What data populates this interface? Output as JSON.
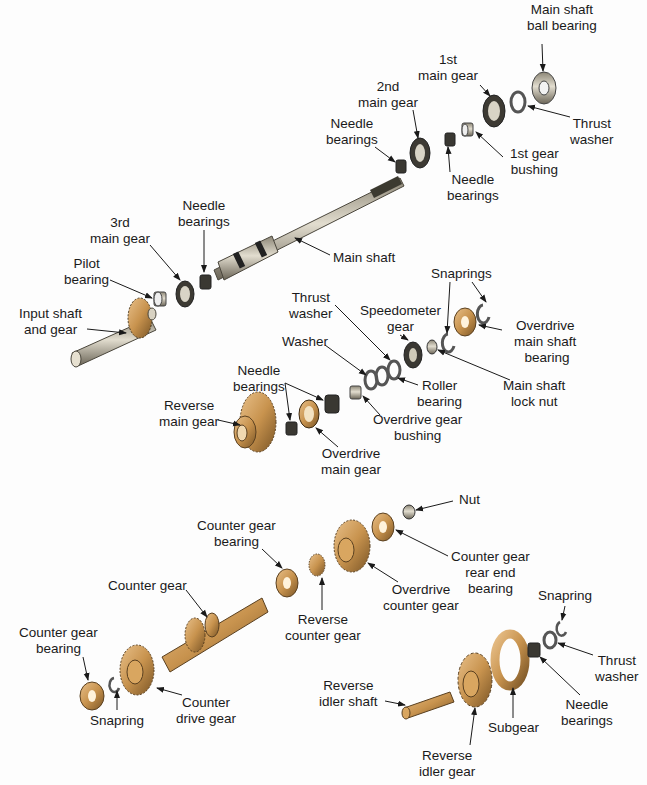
{
  "diagram": {
    "colors": {
      "steel": "#c9c3b4",
      "steel_dark": "#5a5548",
      "bronze": "#c8934e",
      "bronze_dark": "#7a5526",
      "arrow": "#1a1a1a",
      "text": "#1a1a1a"
    },
    "labels": [
      {
        "id": "main-shaft-ball-bearing",
        "text": "Main shaft\nball bearing",
        "x": 562,
        "y": 2,
        "align": "center"
      },
      {
        "id": "1st-main-gear",
        "text": "1st\nmain gear",
        "x": 448,
        "y": 52,
        "align": "center"
      },
      {
        "id": "2nd-main-gear",
        "text": "2nd\nmain gear",
        "x": 388,
        "y": 79,
        "align": "center"
      },
      {
        "id": "thrust-washer-top",
        "text": "Thrust\nwasher",
        "x": 592,
        "y": 116,
        "align": "center"
      },
      {
        "id": "needle-bearings-top-left",
        "text": "Needle\nbearings",
        "x": 352,
        "y": 116,
        "align": "center"
      },
      {
        "id": "1st-gear-bushing",
        "text": "1st gear\nbushing",
        "x": 534,
        "y": 146,
        "align": "center"
      },
      {
        "id": "needle-bearings-top-mid",
        "text": "Needle\nbearings",
        "x": 473,
        "y": 172,
        "align": "center"
      },
      {
        "id": "needle-bearings-3rd",
        "text": "Needle\nbearings",
        "x": 204,
        "y": 198,
        "align": "center"
      },
      {
        "id": "3rd-main-gear",
        "text": "3rd\nmain gear",
        "x": 120,
        "y": 215,
        "align": "center"
      },
      {
        "id": "pilot-bearing",
        "text": "Pilot\nbearing",
        "x": 86,
        "y": 256,
        "align": "center"
      },
      {
        "id": "main-shaft",
        "text": "Main shaft",
        "x": 364,
        "y": 250,
        "align": "center"
      },
      {
        "id": "snaprings",
        "text": "Snaprings",
        "x": 461,
        "y": 266,
        "align": "center"
      },
      {
        "id": "input-shaft-and-gear",
        "text": "Input shaft\nand gear",
        "x": 50,
        "y": 306,
        "align": "center"
      },
      {
        "id": "thrust-washer-mid",
        "text": "Thrust\nwasher",
        "x": 311,
        "y": 290,
        "align": "center"
      },
      {
        "id": "speedometer-gear",
        "text": "Speedometer\ngear",
        "x": 400,
        "y": 303,
        "align": "center"
      },
      {
        "id": "overdrive-main-shaft-bearing",
        "text": "Overdrive\nmain shaft\n bearing",
        "x": 545,
        "y": 318,
        "align": "center"
      },
      {
        "id": "washer",
        "text": "Washer",
        "x": 305,
        "y": 334,
        "align": "center"
      },
      {
        "id": "needle-bearings-mid",
        "text": "Needle\nbearings",
        "x": 259,
        "y": 363,
        "align": "center"
      },
      {
        "id": "roller-bearing",
        "text": "Roller\nbearing",
        "x": 439,
        "y": 378,
        "align": "center"
      },
      {
        "id": "main-shaft-lock-nut",
        "text": "Main shaft\nlock nut",
        "x": 534,
        "y": 378,
        "align": "center"
      },
      {
        "id": "reverse-main-gear",
        "text": "Reverse\nmain gear",
        "x": 189,
        "y": 398,
        "align": "center"
      },
      {
        "id": "overdrive-gear-bushing",
        "text": "Overdrive gear\nbushing",
        "x": 417,
        "y": 412,
        "align": "center"
      },
      {
        "id": "overdrive-main-gear",
        "text": "Overdrive\nmain gear",
        "x": 351,
        "y": 446,
        "align": "center"
      },
      {
        "id": "nut",
        "text": "Nut",
        "x": 469,
        "y": 492,
        "align": "center"
      },
      {
        "id": "counter-gear-bearing-top",
        "text": "Counter gear\nbearing",
        "x": 236,
        "y": 518,
        "align": "center"
      },
      {
        "id": "counter-gear-rear-end-bearing",
        "text": "Counter gear\nrear end\nbearing",
        "x": 490,
        "y": 549,
        "align": "center"
      },
      {
        "id": "overdrive-counter-gear",
        "text": "Overdrive\ncounter gear",
        "x": 421,
        "y": 582,
        "align": "center"
      },
      {
        "id": "counter-gear",
        "text": "Counter gear",
        "x": 147,
        "y": 578,
        "align": "center"
      },
      {
        "id": "snapring-right",
        "text": "Snapring",
        "x": 565,
        "y": 588,
        "align": "center"
      },
      {
        "id": "reverse-counter-gear",
        "text": "Reverse\ncounter gear",
        "x": 323,
        "y": 612,
        "align": "center"
      },
      {
        "id": "counter-gear-bearing-left",
        "text": "Counter gear\nbearing",
        "x": 58,
        "y": 625,
        "align": "center"
      },
      {
        "id": "thrust-washer-bottom",
        "text": "Thrust\nwasher",
        "x": 617,
        "y": 653,
        "align": "center"
      },
      {
        "id": "counter-drive-gear",
        "text": "Counter\ndrive gear",
        "x": 206,
        "y": 695,
        "align": "center"
      },
      {
        "id": "snapring-left",
        "text": "Snapring",
        "x": 117,
        "y": 713,
        "align": "center"
      },
      {
        "id": "reverse-idler-shaft",
        "text": "Reverse\nidler shaft",
        "x": 348,
        "y": 678,
        "align": "center"
      },
      {
        "id": "needle-bearings-bottom",
        "text": "Needle\nbearings",
        "x": 587,
        "y": 697,
        "align": "center"
      },
      {
        "id": "subgear",
        "text": "Subgear",
        "x": 513,
        "y": 720,
        "align": "center"
      },
      {
        "id": "reverse-idler-gear",
        "text": "Reverse\nidler gear",
        "x": 447,
        "y": 748,
        "align": "center"
      }
    ]
  }
}
